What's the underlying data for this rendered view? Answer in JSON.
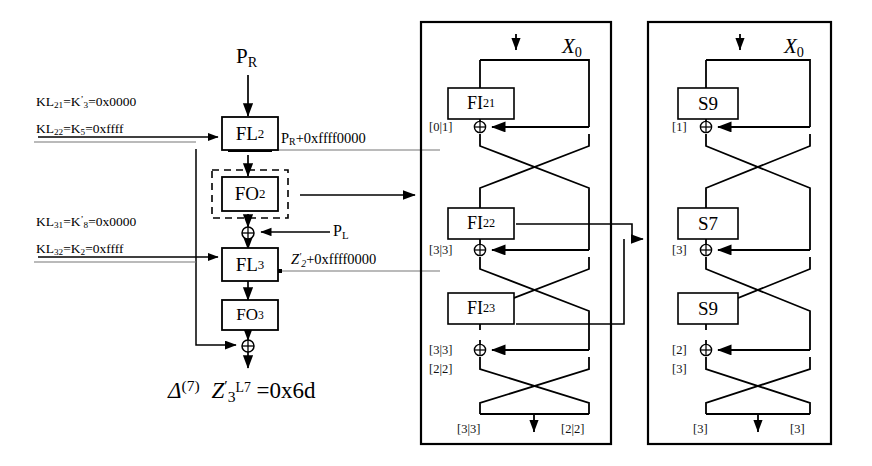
{
  "figure": {
    "bottom_formula": {
      "delta": "Δ",
      "delta_sup": "(7)",
      "var": "Z",
      "var_prime": "′",
      "var_sub": "3",
      "var_sup": "L7",
      "equals": "=0x6d"
    }
  },
  "left_column": {
    "input_label": "P",
    "input_sub": "R",
    "boxes": [
      {
        "name": "fl2",
        "label": "FL",
        "sub": "2",
        "dashed": false
      },
      {
        "name": "fo2",
        "label": "FO",
        "sub": "2",
        "dashed": true
      },
      {
        "name": "fl3",
        "label": "FL",
        "sub": "3",
        "dashed": false
      },
      {
        "name": "fo3",
        "label": "FO",
        "sub": "3",
        "dashed": false
      }
    ],
    "xor_inputs": [
      {
        "name": "p-l",
        "label": "P",
        "sub": "L"
      }
    ],
    "annotations": [
      {
        "name": "fl2-output",
        "base": "P",
        "sub": "R",
        "rest": "+0xffff0000"
      },
      {
        "name": "fl3-output",
        "base": "Z",
        "prime": "′",
        "sub": "2",
        "rest": "+0xffff0000"
      }
    ],
    "key_schedule": [
      {
        "name": "kl21",
        "lhs": "KL",
        "lhs_sub": "21",
        "mid": "K",
        "mid_prime": "’",
        "mid_sub": "3",
        "value": "=0x0000",
        "underlined": false
      },
      {
        "name": "kl22",
        "lhs": "KL",
        "lhs_sub": "22",
        "mid": "K",
        "mid_prime": "",
        "mid_sub": "5",
        "value": "=0xffff",
        "underlined": true
      },
      {
        "name": "kl31",
        "lhs": "KL",
        "lhs_sub": "31",
        "mid": "K",
        "mid_prime": "’",
        "mid_sub": "8",
        "value": "=0x0000",
        "underlined": false
      },
      {
        "name": "kl32",
        "lhs": "KL",
        "lhs_sub": "32",
        "mid": "K",
        "mid_prime": "",
        "mid_sub": "2",
        "value": "=0xffff",
        "underlined": true
      }
    ]
  },
  "fo_panel": {
    "name": "fo-function-panel",
    "top_var": "X",
    "top_sub": "0",
    "stages": [
      {
        "name": "fi21",
        "label": "FI",
        "sub": "21",
        "xor_label": "[0|1]"
      },
      {
        "name": "fi22",
        "label": "FI",
        "sub": "22",
        "xor_label": "[3|3]"
      },
      {
        "name": "fi23",
        "label": "FI",
        "sub": "23",
        "xor_label": "[3|3]",
        "extra_label": "[2|2]"
      }
    ],
    "outputs": {
      "left": "[3|3]",
      "right": "[2|2]"
    }
  },
  "fi_panel": {
    "name": "fi-function-panel",
    "top_var": "X",
    "top_sub": "0",
    "stages": [
      {
        "name": "s9-top",
        "label": "S9",
        "xor_label": "[1]"
      },
      {
        "name": "s7-mid",
        "label": "S7",
        "xor_label": "[3]"
      },
      {
        "name": "s9-bottom",
        "label": "S9",
        "xor_label": "[2]",
        "extra_label": "[3]"
      }
    ],
    "outputs": {
      "left": "[3]",
      "right": "[3]"
    }
  },
  "colors": {
    "ink": "#000000",
    "panel_border": "#000000",
    "background": "#ffffff"
  }
}
